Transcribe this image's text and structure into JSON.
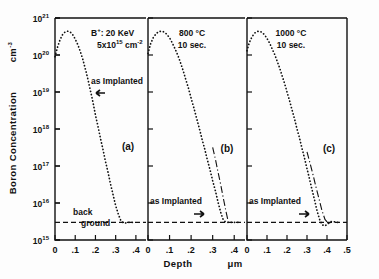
{
  "figure": {
    "y_axis_title": "Boron Concentration",
    "y_axis_units": "cm",
    "y_axis_units_exp": "-3",
    "x_axis_title": "Depth",
    "x_axis_units": "μm",
    "background_label_line1": "back",
    "background_label_line2": "ground",
    "as_implanted_label": "as Implanted",
    "ion_label_prefix": "B",
    "ion_label_sup": "+",
    "ion_label_energy": ": 20 KeV",
    "dose_mantissa": "5x10",
    "dose_exp": "15",
    "dose_units": "cm",
    "dose_units_exp": "-2"
  },
  "chart_data": {
    "type": "line",
    "xlabel": "Depth",
    "xunits": "μm",
    "ylabel": "Boron Concentration",
    "yunits": "cm^-3",
    "yscale": "log",
    "ylim": [
      1000000000000000.0,
      1e+21
    ],
    "ytick_labels": [
      "10^15",
      "10^16",
      "10^17",
      "10^18",
      "10^19",
      "10^20",
      "10^21"
    ],
    "ytick_values": [
      1000000000000000.0,
      1e+16,
      1e+17,
      1e+18,
      1e+19,
      1e+20,
      1e+21
    ],
    "grid": false,
    "legend": "none",
    "background_level": 3000000000000000.0,
    "implant_species": "B+",
    "implant_energy_keV": 20,
    "implant_dose_cm2": 5000000000000000.0,
    "panels": [
      {
        "id": "(a)",
        "condition": "as implanted",
        "annotation_lines": [
          "B+ : 20 KeV",
          "5x10^15 cm^-2"
        ],
        "arrow_label": "as Implanted",
        "arrow_direction": "left",
        "xlim": [
          0,
          0.45
        ],
        "xtick_labels": [
          "0",
          ".1",
          ".2",
          ".3",
          ".4"
        ],
        "xtick_values": [
          0,
          0.1,
          0.2,
          0.3,
          0.4
        ],
        "series": [
          {
            "name": "as-implanted",
            "style": "dotted",
            "x": [
              0.0,
              0.012,
              0.025,
              0.038,
              0.05,
              0.063,
              0.075,
              0.088,
              0.1,
              0.113,
              0.125,
              0.138,
              0.15,
              0.163,
              0.175,
              0.188,
              0.2,
              0.213,
              0.225,
              0.238,
              0.25,
              0.263,
              0.275,
              0.288,
              0.3,
              0.313,
              0.325,
              0.338,
              0.35,
              0.363,
              0.375,
              0.385,
              0.392
            ],
            "y": [
              9e+19,
              1.6e+20,
              2.6e+20,
              3.6e+20,
              4.2e+20,
              4.4e+20,
              4.2e+20,
              3.5e+20,
              2.7e+20,
              1.9e+20,
              1.25e+20,
              7.5e+19,
              4.2e+19,
              2.2e+19,
              1.1e+19,
              5.2e+18,
              2.4e+18,
              1.15e+18,
              5.5e+17,
              2.7e+17,
              1.3e+17,
              6.5e+16,
              3.2e+16,
              1.6e+16,
              8500000000000000.0,
              5000000000000000.0,
              3400000000000000.0,
              2900000000000000.0,
              2900000000000000.0,
              3000000000000000.0,
              3000000000000000.0,
              3000000000000000.0,
              3000000000000000.0
            ]
          }
        ]
      },
      {
        "id": "(b)",
        "condition": "800 °C 10 sec.",
        "annotation_lines": [
          "800 °C",
          "10 sec."
        ],
        "arrow_label": "as Implanted",
        "arrow_direction": "right",
        "xlim": [
          0,
          0.45
        ],
        "xtick_labels": [
          "0",
          ".1",
          ".2",
          ".3",
          ".4"
        ],
        "xtick_values": [
          0,
          0.1,
          0.2,
          0.3,
          0.4
        ],
        "series": [
          {
            "name": "annealed 800C 10s",
            "style": "dotted",
            "x": [
              0.0,
              0.012,
              0.025,
              0.038,
              0.05,
              0.063,
              0.075,
              0.088,
              0.1,
              0.113,
              0.125,
              0.138,
              0.15,
              0.163,
              0.175,
              0.188,
              0.2,
              0.213,
              0.225,
              0.238,
              0.25,
              0.263,
              0.275,
              0.288,
              0.3,
              0.313,
              0.325,
              0.338,
              0.35,
              0.363,
              0.375,
              0.388,
              0.4,
              0.412,
              0.42
            ],
            "y": [
              1.1e+20,
              2e+20,
              3e+20,
              3.8e+20,
              4.3e+20,
              4.4e+20,
              4.2e+20,
              3.6e+20,
              2.9e+20,
              2.1e+20,
              1.5e+20,
              1e+20,
              6.4e+19,
              3.8e+19,
              2.2e+19,
              1.25e+19,
              6.8e+18,
              3.7e+18,
              2e+18,
              1.05e+18,
              5.5e+17,
              2.9e+17,
              1.5e+17,
              7.8e+16,
              4e+16,
              2.1e+16,
              1.05e+16,
              5400000000000000.0,
              3400000000000000.0,
              3000000000000000.0,
              3000000000000000.0,
              3000000000000000.0,
              3000000000000000.0,
              3000000000000000.0,
              3000000000000000.0
            ]
          },
          {
            "name": "as-implanted reference",
            "style": "dash-dot",
            "x": [
              0.3,
              0.313,
              0.325,
              0.338,
              0.35,
              0.363,
              0.372
            ],
            "y": [
              3.2e+17,
              1.5e+17,
              6.8e+16,
              3e+16,
              1.3e+16,
              5500000000000000.0,
              3200000000000000.0
            ]
          }
        ]
      },
      {
        "id": "(c)",
        "condition": "1000 °C 10 sec.",
        "annotation_lines": [
          "1000 °C",
          "10 sec."
        ],
        "arrow_label": "as Implanted",
        "arrow_direction": "right",
        "xlim": [
          0,
          0.5
        ],
        "xtick_labels": [
          "0",
          ".1",
          ".2",
          ".3",
          ".4",
          ".5"
        ],
        "xtick_values": [
          0,
          0.1,
          0.2,
          0.3,
          0.4,
          0.5
        ],
        "series": [
          {
            "name": "annealed 1000C 10s",
            "style": "dotted",
            "x": [
              0.0,
              0.012,
              0.025,
              0.038,
              0.05,
              0.063,
              0.075,
              0.088,
              0.1,
              0.113,
              0.125,
              0.138,
              0.15,
              0.163,
              0.175,
              0.188,
              0.2,
              0.213,
              0.225,
              0.238,
              0.25,
              0.263,
              0.275,
              0.288,
              0.3,
              0.313,
              0.325,
              0.338,
              0.35,
              0.363,
              0.375,
              0.388,
              0.4,
              0.412,
              0.425,
              0.438,
              0.45,
              0.462
            ],
            "y": [
              1.3e+20,
              2.2e+20,
              3.1e+20,
              3.9e+20,
              4.3e+20,
              4.4e+20,
              4.1e+20,
              3.5e+20,
              2.8e+20,
              2.1e+20,
              1.5e+20,
              1.05e+20,
              7e+19,
              4.5e+19,
              2.8e+19,
              1.7e+19,
              1e+19,
              5.8e+18,
              3.3e+18,
              1.85e+18,
              1e+18,
              5.6e+17,
              3e+17,
              1.6e+17,
              8.5e+16,
              4.4e+16,
              2.3e+16,
              1.2e+16,
              6200000000000000.0,
              3600000000000000.0,
              2600000000000000.0,
              2400000000000000.0,
              2600000000000000.0,
              3000000000000000.0,
              3200000000000000.0,
              3100000000000000.0,
              3000000000000000.0,
              3000000000000000.0
            ]
          },
          {
            "name": "as-implanted reference",
            "style": "dash-dot",
            "x": [
              0.3,
              0.315,
              0.33,
              0.345,
              0.36,
              0.375,
              0.39,
              0.405,
              0.418
            ],
            "y": [
              2.4e+17,
              1.2e+17,
              5.8e+16,
              2.7e+16,
              1.3e+16,
              6200000000000000.0,
              3600000000000000.0,
              2900000000000000.0,
              2900000000000000.0
            ]
          }
        ]
      }
    ]
  }
}
